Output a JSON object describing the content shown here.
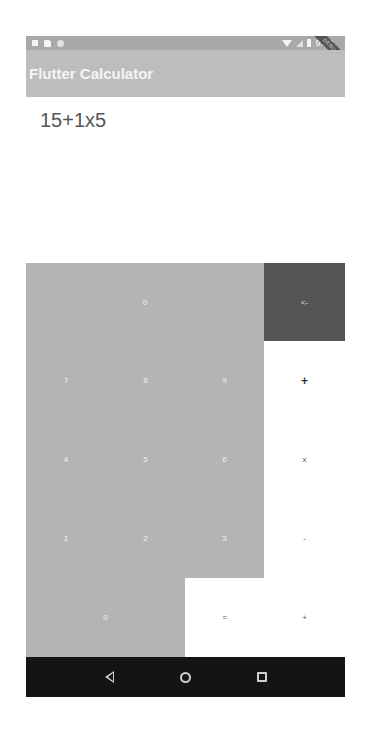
{
  "status_bar": {
    "left_icons": [
      "notification-icon",
      "sim-card-icon",
      "sync-icon"
    ],
    "right_icons": [
      "wifi-icon",
      "cellular-signal-icon",
      "battery-icon"
    ],
    "time": "9:02",
    "debug_banner": "DEBUG"
  },
  "app_bar": {
    "title": "Flutter Calculator"
  },
  "display": {
    "expression": "15+1x5"
  },
  "keypad": {
    "result": "0",
    "backspace": "<-",
    "keys": {
      "seven": "7",
      "eight": "8",
      "nine": "9",
      "add_top": "+",
      "four": "4",
      "five": "5",
      "six": "6",
      "multiply": "x",
      "one": "1",
      "two": "2",
      "three": "3",
      "subtract": "-",
      "zero": "0",
      "equals": "=",
      "add": "+"
    }
  },
  "colors": {
    "app_bar": "#bdbdbd",
    "status_bar": "#a9a9a9",
    "number_key": "#b4b4b4",
    "backspace_key": "#555555",
    "operator_key": "#ffffff",
    "nav_bar": "#141414"
  },
  "nav_bar": {
    "buttons": [
      "back",
      "home",
      "recents"
    ]
  }
}
